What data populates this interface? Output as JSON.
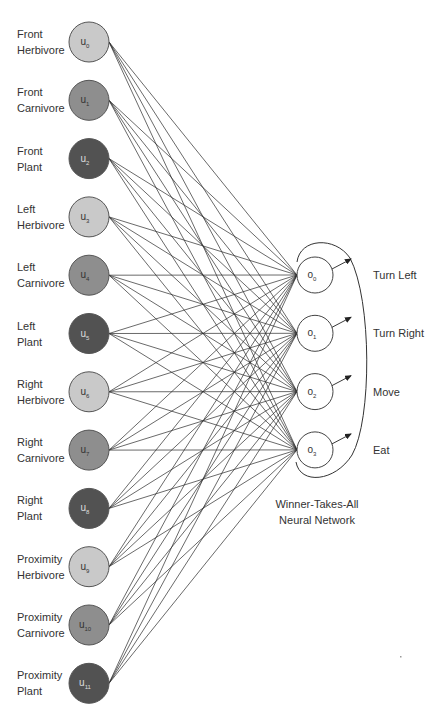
{
  "diagram": {
    "title": "Winner-Takes-All Neural Network",
    "caption_lines": [
      "Winner-Takes-All",
      "Neural Network"
    ],
    "colors": {
      "herbivore": "#c9c9c9",
      "carnivore": "#8e8e8e",
      "plant": "#525252",
      "output_fill": "#ffffff",
      "stroke": "#333333",
      "edge": "#2a2a2a",
      "label_text": "#333333"
    },
    "inputs": [
      {
        "id": "u",
        "sub": "0",
        "line1": "Front",
        "line2": "Herbivore",
        "type": "herbivore"
      },
      {
        "id": "u",
        "sub": "1",
        "line1": "Front",
        "line2": "Carnivore",
        "type": "carnivore"
      },
      {
        "id": "u",
        "sub": "2",
        "line1": "Front",
        "line2": "Plant",
        "type": "plant"
      },
      {
        "id": "u",
        "sub": "3",
        "line1": "Left",
        "line2": "Herbivore",
        "type": "herbivore"
      },
      {
        "id": "u",
        "sub": "4",
        "line1": "Left",
        "line2": "Carnivore",
        "type": "carnivore"
      },
      {
        "id": "u",
        "sub": "5",
        "line1": "Left",
        "line2": "Plant",
        "type": "plant"
      },
      {
        "id": "u",
        "sub": "6",
        "line1": "Right",
        "line2": "Herbivore",
        "type": "herbivore"
      },
      {
        "id": "u",
        "sub": "7",
        "line1": "Right",
        "line2": "Carnivore",
        "type": "carnivore"
      },
      {
        "id": "u",
        "sub": "8",
        "line1": "Right",
        "line2": "Plant",
        "type": "plant"
      },
      {
        "id": "u",
        "sub": "9",
        "line1": "Proximity",
        "line2": "Herbivore",
        "type": "herbivore"
      },
      {
        "id": "u",
        "sub": "10",
        "line1": "Proximity",
        "line2": "Carnivore",
        "type": "carnivore"
      },
      {
        "id": "u",
        "sub": "11",
        "line1": "Proximity",
        "line2": "Plant",
        "type": "plant"
      }
    ],
    "outputs": [
      {
        "id": "o",
        "sub": "0",
        "label": "Turn Left"
      },
      {
        "id": "o",
        "sub": "1",
        "label": "Turn Right"
      },
      {
        "id": "o",
        "sub": "2",
        "label": "Move"
      },
      {
        "id": "o",
        "sub": "3",
        "label": "Eat"
      }
    ],
    "connectivity": "fully-connected",
    "layout": {
      "input_cx": 89,
      "input_y0": 42,
      "input_dy": 58.3,
      "input_r": 20,
      "output_cx": 315,
      "output_y0": 275,
      "output_dy": 58.3,
      "output_r": 18
    }
  }
}
